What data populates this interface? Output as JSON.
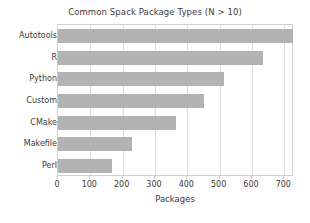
{
  "chart_data": {
    "type": "bar",
    "orientation": "horizontal",
    "title": "Common Spack Package Types (N > 10)",
    "xlabel": "Packages",
    "ylabel": "",
    "categories": [
      "Autotools",
      "R",
      "Python",
      "Custom",
      "CMake",
      "Makefile",
      "Perl"
    ],
    "values": [
      727,
      634,
      512,
      451,
      366,
      229,
      168
    ],
    "xlim": [
      0,
      730
    ],
    "xticks": [
      0,
      100,
      200,
      300,
      400,
      500,
      600,
      700
    ],
    "xtick_labels": [
      "0",
      "100",
      "200",
      "300",
      "400",
      "500",
      "600",
      "700"
    ],
    "grid": "vertical",
    "legend": "none",
    "bar_color": "#b3b3b3",
    "frame_color": "#cfcfcf",
    "text_color": "#3a3a3a"
  }
}
